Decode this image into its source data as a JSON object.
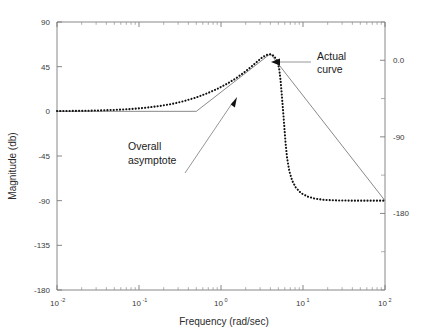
{
  "chart_data": {
    "type": "line",
    "title": "",
    "xlabel": "Frequency (rad/sec)",
    "ylabel": "Magnitude (db)",
    "ylabel_right": "",
    "xscale": "log",
    "xlim": [
      0.01,
      100
    ],
    "ylim": [
      -180,
      90
    ],
    "ylim_right": [
      -270,
      45
    ],
    "grid": false,
    "legend": "none",
    "xticks": [
      "10",
      "10",
      "10",
      "10",
      "10"
    ],
    "xtick_exponents": [
      "-2",
      "-1",
      "0",
      "1",
      "2"
    ],
    "xtick_values": [
      0.01,
      0.1,
      1,
      10,
      100
    ],
    "yticks_left": [
      "90",
      "45",
      "0",
      "-45",
      "-90",
      "-135",
      "-180"
    ],
    "ytick_values_left": [
      90,
      45,
      0,
      -45,
      -90,
      -135,
      -180
    ],
    "yticks_right": [
      "0.0",
      "-90",
      "-180"
    ],
    "ytick_values_right": [
      0,
      -90,
      -180
    ],
    "series": [
      {
        "name": "Actual curve",
        "style": "dotted",
        "color": "#111111",
        "points": [
          [
            0.01,
            0.3
          ],
          [
            0.02,
            0.5
          ],
          [
            0.03,
            0.8
          ],
          [
            0.05,
            1.4
          ],
          [
            0.08,
            2.3
          ],
          [
            0.12,
            3.6
          ],
          [
            0.18,
            5.4
          ],
          [
            0.25,
            7.4
          ],
          [
            0.35,
            10.2
          ],
          [
            0.5,
            14.0
          ],
          [
            0.7,
            18.6
          ],
          [
            0.9,
            22.6
          ],
          [
            1.2,
            28.0
          ],
          [
            1.5,
            33.0
          ],
          [
            1.9,
            39.0
          ],
          [
            2.3,
            44.5
          ],
          [
            2.8,
            50.5
          ],
          [
            3.2,
            54.5
          ],
          [
            3.6,
            56.8
          ],
          [
            4.0,
            57.4
          ],
          [
            4.4,
            56.0
          ],
          [
            4.8,
            51.5
          ],
          [
            5.1,
            44.0
          ],
          [
            5.3,
            33.0
          ],
          [
            5.5,
            18.0
          ],
          [
            5.7,
            2.0
          ],
          [
            5.9,
            -14.0
          ],
          [
            6.1,
            -30.0
          ],
          [
            6.4,
            -47.0
          ],
          [
            6.8,
            -60.0
          ],
          [
            7.4,
            -70.0
          ],
          [
            8.2,
            -77.0
          ],
          [
            9.5,
            -82.5
          ],
          [
            11.5,
            -86.0
          ],
          [
            14,
            -88.0
          ],
          [
            18,
            -89.2
          ],
          [
            25,
            -89.7
          ],
          [
            40,
            -90.0
          ],
          [
            70,
            -90.0
          ],
          [
            100,
            -90.0
          ]
        ]
      },
      {
        "name": "Overall asymptote",
        "style": "solid",
        "color": "#8a8a8a",
        "points": [
          [
            0.01,
            0.0
          ],
          [
            0.5,
            0.0
          ],
          [
            4.0,
            58.0
          ],
          [
            100,
            -90.0
          ]
        ]
      }
    ],
    "annotations": [
      {
        "text": "Actual curve",
        "lines": [
          "Actual",
          "curve"
        ],
        "target_series": "Actual curve"
      },
      {
        "text": "Overall asymptote",
        "lines": [
          "Overall",
          "asymptote"
        ],
        "target_series": "Overall asymptote"
      }
    ]
  },
  "axes": {
    "x_title": "Frequency (rad/sec)",
    "y_title": "Magnitude (db)"
  },
  "ticks": {
    "x": [
      {
        "mantissa": "10",
        "exp": "-2"
      },
      {
        "mantissa": "10",
        "exp": "-1"
      },
      {
        "mantissa": "10",
        "exp": "0"
      },
      {
        "mantissa": "10",
        "exp": "1"
      },
      {
        "mantissa": "10",
        "exp": "2"
      }
    ],
    "y_left": [
      "90",
      "45",
      "0",
      "-45",
      "-90",
      "-135",
      "-180"
    ],
    "y_right": [
      "0.0",
      "-90",
      "-180"
    ]
  },
  "labels": {
    "actual_line1": "Actual",
    "actual_line2": "curve",
    "asymptote_line1": "Overall",
    "asymptote_line2": "asymptote"
  },
  "colors": {
    "actual_curve": "#111111",
    "asymptote": "#8a8a8a",
    "axis": "#7a7a7a",
    "text": "#2b2b2b",
    "background": "#ffffff"
  }
}
